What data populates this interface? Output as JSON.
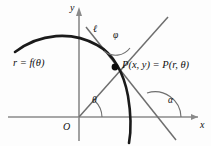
{
  "figure": {
    "kind": "polar-tangent-diagram",
    "background_color": "#fdfdfd",
    "ink_color": "#111111",
    "axis_color": "#8a8a8a",
    "line_color": "#6e6e6e",
    "curve_color": "#1a1a1a",
    "axes": {
      "y_label": "y",
      "x_label": "x",
      "origin_label": "O"
    },
    "curve": {
      "label": "r = f(θ)"
    },
    "point": {
      "label": "P(x, y) = P(r, θ)",
      "marker": "filled-dot"
    },
    "lines": {
      "tangent_label": "ℓ"
    },
    "angles": {
      "phi": "φ",
      "theta": "θ",
      "alpha": "α"
    }
  }
}
